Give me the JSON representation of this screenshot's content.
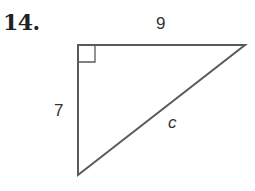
{
  "problem": {
    "number": "14."
  },
  "triangle": {
    "type": "right",
    "right_angle_vertex": "top-left",
    "sides": {
      "top": "9",
      "left": "7",
      "hypotenuse": "c"
    },
    "stroke_color": "#5a5a5a"
  }
}
